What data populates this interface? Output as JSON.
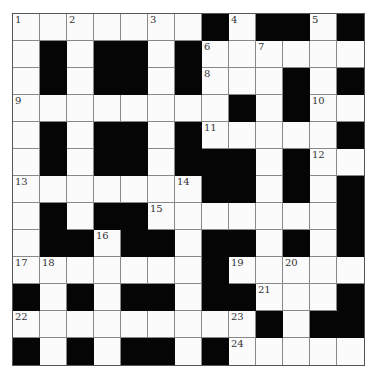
{
  "puzzle": {
    "type": "crossword",
    "rows": 13,
    "cols": 13,
    "grid": [
      "WWWWWWWBWBBWB",
      "WBWBBWBWWWWWW",
      "WBWBBWBWWWBWB",
      "WWWWWWWWBWBWW",
      "WBWBBWBWWWWWB",
      "WBWBBWBBBWBWW",
      "WWWWWWWBBWBWB",
      "WBWBBWWWWWWWB",
      "WBBWBBWBBWBWB",
      "WWWWWWWBWWWWW",
      "BWBWBBWBBWWWB",
      "WWWWWWWWWBWBB",
      "BWBWBBWBWWWWW"
    ],
    "numbers": [
      {
        "r": 0,
        "c": 0,
        "n": "1"
      },
      {
        "r": 0,
        "c": 2,
        "n": "2"
      },
      {
        "r": 0,
        "c": 5,
        "n": "3"
      },
      {
        "r": 0,
        "c": 8,
        "n": "4"
      },
      {
        "r": 0,
        "c": 11,
        "n": "5"
      },
      {
        "r": 1,
        "c": 7,
        "n": "6"
      },
      {
        "r": 1,
        "c": 9,
        "n": "7"
      },
      {
        "r": 2,
        "c": 7,
        "n": "8"
      },
      {
        "r": 3,
        "c": 0,
        "n": "9"
      },
      {
        "r": 3,
        "c": 11,
        "n": "10"
      },
      {
        "r": 4,
        "c": 7,
        "n": "11"
      },
      {
        "r": 5,
        "c": 11,
        "n": "12"
      },
      {
        "r": 6,
        "c": 0,
        "n": "13"
      },
      {
        "r": 6,
        "c": 6,
        "n": "14"
      },
      {
        "r": 7,
        "c": 5,
        "n": "15"
      },
      {
        "r": 8,
        "c": 3,
        "n": "16"
      },
      {
        "r": 9,
        "c": 0,
        "n": "17"
      },
      {
        "r": 9,
        "c": 1,
        "n": "18"
      },
      {
        "r": 9,
        "c": 8,
        "n": "19"
      },
      {
        "r": 9,
        "c": 10,
        "n": "20"
      },
      {
        "r": 10,
        "c": 9,
        "n": "21"
      },
      {
        "r": 11,
        "c": 0,
        "n": "22"
      },
      {
        "r": 11,
        "c": 8,
        "n": "23"
      },
      {
        "r": 12,
        "c": 8,
        "n": "24"
      }
    ],
    "colors": {
      "black": "#050505",
      "white": "#fbfbfb",
      "line": "#888888"
    }
  }
}
